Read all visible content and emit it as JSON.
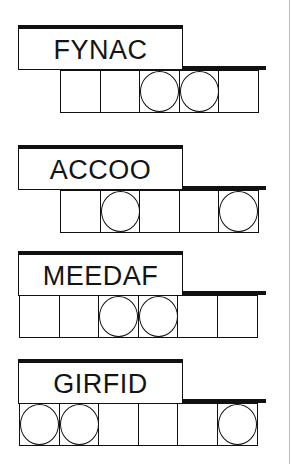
{
  "colors": {
    "ink": "#111111",
    "background": "#ffffff",
    "rule": "#bdbdbd"
  },
  "puzzles": [
    {
      "word": "FYNAC",
      "top": 25,
      "cells_left": 60,
      "cell_count": 5,
      "circled_cells": [
        3,
        4
      ]
    },
    {
      "word": "ACCOO",
      "top": 145,
      "cells_left": 60,
      "cell_count": 5,
      "circled_cells": [
        2,
        5
      ]
    },
    {
      "word": "MEEDAF",
      "top": 251,
      "cells_left": 19,
      "cell_count": 6,
      "circled_cells": [
        3,
        4
      ]
    },
    {
      "word": "GIRFID",
      "top": 359,
      "cells_left": 19,
      "cell_count": 6,
      "circled_cells": [
        1,
        2,
        6
      ]
    }
  ]
}
